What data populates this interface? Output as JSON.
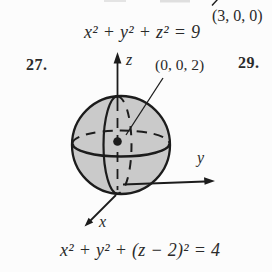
{
  "colors": {
    "background": "#fcfcfc",
    "text": "#2a2a2a",
    "sphere_fill": "#cacaca",
    "line": "#1c1c1c"
  },
  "top": {
    "point_label": "(3, 0, 0)",
    "equation": "x² + y² + z² = 9"
  },
  "problem_numbers": {
    "left": "27.",
    "right": "29."
  },
  "figure": {
    "z_axis_label": "z",
    "y_axis_label": "y",
    "x_axis_label": "x",
    "center_point_label": "(0, 0, 2)",
    "equation": "x² + y² + (z − 2)² = 4"
  }
}
